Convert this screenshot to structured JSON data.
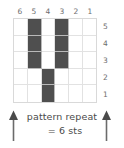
{
  "chart_data": {
    "type": "heatmap",
    "title": "",
    "subtitle": "",
    "xlabel": "",
    "ylabel": "",
    "grid": true,
    "legend_position": "none",
    "columns": 6,
    "rows": 5,
    "column_labels": [
      "6",
      "5",
      "4",
      "3",
      "2",
      "1"
    ],
    "row_labels": [
      "5",
      "4",
      "3",
      "2",
      "1"
    ],
    "cell_states": [
      [
        0,
        1,
        0,
        1,
        0,
        0
      ],
      [
        0,
        1,
        0,
        1,
        0,
        0
      ],
      [
        0,
        1,
        0,
        1,
        0,
        0
      ],
      [
        0,
        0,
        1,
        0,
        0,
        0
      ],
      [
        0,
        0,
        1,
        0,
        0,
        0
      ]
    ],
    "filled_color": "#4f4f4f",
    "empty_color": "#ffffff",
    "gridline_color": "#e2e2e2",
    "annotations": [
      "pattern repeat",
      "= 6 sts"
    ]
  },
  "columns": {
    "labels": [
      "6",
      "5",
      "4",
      "3",
      "2",
      "1"
    ]
  },
  "rows": {
    "labels": [
      "5",
      "4",
      "3",
      "2",
      "1"
    ]
  },
  "caption": {
    "line1": "pattern repeat",
    "line2": "= 6 sts"
  },
  "arrows": {
    "left_icon": "arrow-up-icon",
    "right_icon": "arrow-up-icon",
    "color": "#6b6b6b"
  }
}
